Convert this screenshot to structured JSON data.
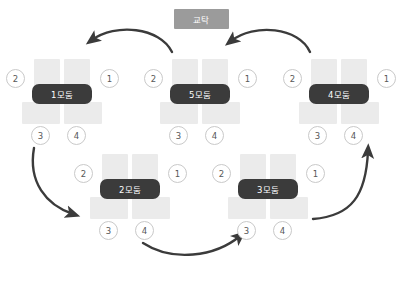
{
  "diagram": {
    "title_box": {
      "label": "교탁",
      "name": "podium",
      "color": "#9b9b9b"
    },
    "seat_label_top_left": "2",
    "seat_label_top_right": "1",
    "seat_label_bottom_left": "3",
    "seat_label_bottom_right": "4",
    "colors": {
      "desk": "#ebebeb",
      "pill": "#3b3b3b",
      "arrow": "#3b3b3b",
      "seat_border": "#c9c9c9",
      "background": "#ffffff"
    },
    "groups": [
      {
        "id": "group-1",
        "label": "1모둠",
        "x": 4,
        "y": 57,
        "seats": [
          "2",
          "1",
          "3",
          "4"
        ]
      },
      {
        "id": "group-5",
        "label": "5모둠",
        "x": 142,
        "y": 57,
        "seats": [
          "2",
          "1",
          "3",
          "4"
        ]
      },
      {
        "id": "group-4",
        "label": "4모둠",
        "x": 281,
        "y": 57,
        "seats": [
          "2",
          "1",
          "3",
          "4"
        ]
      },
      {
        "id": "group-2",
        "label": "2모둠",
        "x": 72,
        "y": 152,
        "seats": [
          "2",
          "1",
          "3",
          "4"
        ]
      },
      {
        "id": "group-3",
        "label": "3모둠",
        "x": 210,
        "y": 152,
        "seats": [
          "2",
          "1",
          "3",
          "4"
        ]
      }
    ],
    "arrows": [
      {
        "id": "arrow-5-to-1",
        "from": "5모둠",
        "to": "1모둠",
        "direction": "left"
      },
      {
        "id": "arrow-4-to-5",
        "from": "4모둠",
        "to": "5모둠",
        "direction": "left"
      },
      {
        "id": "arrow-1-to-2",
        "from": "1모둠",
        "to": "2모둠",
        "direction": "down-right"
      },
      {
        "id": "arrow-2-to-3",
        "from": "2모둠",
        "to": "3모둠",
        "direction": "right"
      },
      {
        "id": "arrow-3-to-4",
        "from": "3모둠",
        "to": "4모둠",
        "direction": "up-right"
      }
    ]
  }
}
